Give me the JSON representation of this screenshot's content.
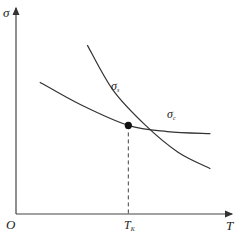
{
  "chart_data": {
    "type": "line",
    "title": "",
    "xlabel": "T",
    "ylabel": "σ",
    "origin_label": "O",
    "xlim": [
      0,
      1
    ],
    "ylim": [
      0,
      1
    ],
    "series": [
      {
        "name": "σs",
        "label_main": "σ",
        "label_sub": "s",
        "x": [
          0.33,
          0.45,
          0.6,
          0.75,
          0.9
        ],
        "y": [
          0.82,
          0.6,
          0.43,
          0.3,
          0.22
        ]
      },
      {
        "name": "σc",
        "label_main": "σ",
        "label_sub": "c",
        "x": [
          0.11,
          0.3,
          0.52,
          0.7,
          0.9
        ],
        "y": [
          0.64,
          0.53,
          0.43,
          0.4,
          0.39
        ]
      }
    ],
    "intersection": {
      "x": 0.52,
      "y": 0.43,
      "label_main": "T",
      "label_sub": "K"
    },
    "caption": "图 2 …… 示意图"
  }
}
